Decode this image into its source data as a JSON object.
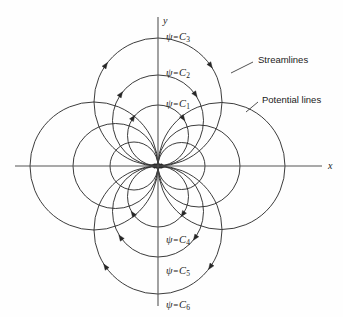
{
  "figure": {
    "width": 343,
    "height": 317,
    "background_color": "#fefefe",
    "curve_color": "#262626",
    "axis_color": "#555555"
  },
  "axes": {
    "x_label": "x",
    "y_label": "y",
    "origin": {
      "x": 158,
      "y": 166
    },
    "x_axis": {
      "x1": 15,
      "y1": 166,
      "x2": 322,
      "y2": 166
    },
    "y_axis": {
      "x1": 158,
      "y1": 17,
      "x2": 158,
      "y2": 306
    }
  },
  "callouts": [
    {
      "name": "streamlines",
      "label": "Streamlines",
      "text_x": 258,
      "text_y": 55,
      "leader": {
        "x1": 253,
        "y1": 62,
        "x2": 231,
        "y2": 73
      }
    },
    {
      "name": "potential-lines",
      "label": "Potential lines",
      "text_x": 262,
      "text_y": 95,
      "leader": {
        "x1": 258,
        "y1": 102,
        "x2": 246,
        "y2": 112
      }
    }
  ],
  "psi_labels": [
    {
      "id": "C3",
      "text_prefix": "ψ",
      "eq": "=",
      "base": "C",
      "sub": "3",
      "x": 166,
      "y": 32
    },
    {
      "id": "C2",
      "text_prefix": "ψ",
      "eq": "=",
      "base": "C",
      "sub": "2",
      "x": 166,
      "y": 68
    },
    {
      "id": "C1",
      "text_prefix": "ψ",
      "eq": "=",
      "base": "C",
      "sub": "1",
      "x": 166,
      "y": 99
    },
    {
      "id": "C4",
      "text_prefix": "ψ",
      "eq": "=",
      "base": "C",
      "sub": "4",
      "x": 166,
      "y": 235
    },
    {
      "id": "C5",
      "text_prefix": "ψ",
      "eq": "=",
      "base": "C",
      "sub": "5",
      "x": 166,
      "y": 266
    },
    {
      "id": "C6",
      "text_prefix": "ψ",
      "eq": "=",
      "base": "C",
      "sub": "6",
      "x": 166,
      "y": 300
    }
  ],
  "chart_data": {
    "type": "line",
    "xlabel": "x",
    "ylabel": "y",
    "grid": false,
    "legend_position": "annotations",
    "series": [
      {
        "name": "streamlines-upper",
        "family": "streamline",
        "tangent_axis": "x",
        "center_axis": "y",
        "curves": [
          {
            "label": "psi = C1",
            "radius": 30.5,
            "center": {
              "x": 158,
              "y": 135.5
            },
            "axis_crossing": {
              "x": 158,
              "y": 105
            },
            "arrow": true
          },
          {
            "label": "psi = C2",
            "radius": 45.5,
            "center": {
              "x": 158,
              "y": 120.5
            },
            "axis_crossing": {
              "x": 158,
              "y": 75
            },
            "arrow": true
          },
          {
            "label": "psi = C3",
            "radius": 64,
            "center": {
              "x": 158,
              "y": 102
            },
            "axis_crossing": {
              "x": 158,
              "y": 38
            },
            "arrow": true
          }
        ]
      },
      {
        "name": "streamlines-lower",
        "family": "streamline",
        "tangent_axis": "x",
        "center_axis": "y",
        "curves": [
          {
            "label": "psi = C4",
            "radius": 30.5,
            "center": {
              "x": 158,
              "y": 196.5
            },
            "axis_crossing": {
              "x": 158,
              "y": 227
            },
            "arrow": true
          },
          {
            "label": "psi = C5",
            "radius": 45.5,
            "center": {
              "x": 158,
              "y": 211.5
            },
            "axis_crossing": {
              "x": 158,
              "y": 257
            },
            "arrow": true
          },
          {
            "label": "psi = C6",
            "radius": 64,
            "center": {
              "x": 158,
              "y": 230
            },
            "axis_crossing": {
              "x": 158,
              "y": 294
            },
            "arrow": true
          }
        ]
      },
      {
        "name": "potential-lines-right",
        "family": "potential",
        "tangent_axis": "y",
        "center_axis": "x",
        "curves": [
          {
            "radius": 23.5,
            "center": {
              "x": 181.5,
              "y": 166
            },
            "axis_crossing": {
              "x": 205,
              "y": 166
            }
          },
          {
            "radius": 41,
            "center": {
              "x": 199,
              "y": 166
            },
            "axis_crossing": {
              "x": 240,
              "y": 166
            }
          },
          {
            "radius": 63.5,
            "center": {
              "x": 221.5,
              "y": 166
            },
            "axis_crossing": {
              "x": 285,
              "y": 166
            }
          }
        ]
      },
      {
        "name": "potential-lines-left",
        "family": "potential",
        "tangent_axis": "y",
        "center_axis": "x",
        "curves": [
          {
            "radius": 24,
            "center": {
              "x": 134,
              "y": 166
            },
            "axis_crossing": {
              "x": 110,
              "y": 166
            }
          },
          {
            "radius": 42.5,
            "center": {
              "x": 115.5,
              "y": 166
            },
            "axis_crossing": {
              "x": 73,
              "y": 166
            }
          },
          {
            "radius": 64,
            "center": {
              "x": 94,
              "y": 166
            },
            "axis_crossing": {
              "x": 30,
              "y": 166
            }
          }
        ]
      }
    ]
  }
}
